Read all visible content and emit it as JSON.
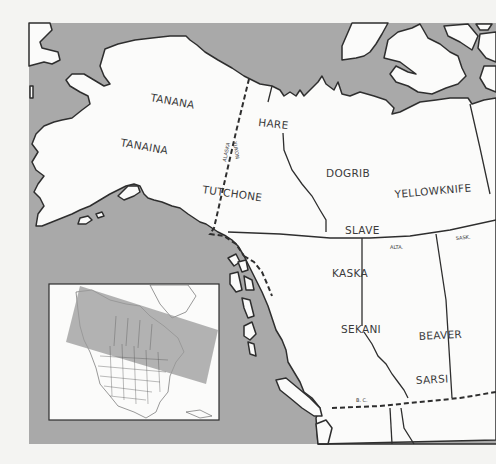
{
  "map": {
    "title": "Athapaskan peoples of northwestern North America",
    "colors": {
      "ocean": "#a9a9a9",
      "land": "#fbfbfa",
      "outline": "#2e2e2e",
      "paper": "#f4f4f2",
      "inset_highlight": "#9a9a9a"
    },
    "tribes": [
      {
        "name": "TANANA",
        "x": 168,
        "y": 101,
        "rotate": 10
      },
      {
        "name": "TANAINA",
        "x": 120,
        "y": 150,
        "rotate": 10
      },
      {
        "name": "TUTCHONE",
        "x": 200,
        "y": 196,
        "rotate": 8
      },
      {
        "name": "HARE",
        "x": 258,
        "y": 126,
        "rotate": 6
      },
      {
        "name": "DOGRIB",
        "x": 326,
        "y": 176,
        "rotate": 0
      },
      {
        "name": "YELLOWKNIFE",
        "x": 394,
        "y": 195,
        "rotate": -5
      },
      {
        "name": "SLAVE",
        "x": 345,
        "y": 232,
        "rotate": 0
      },
      {
        "name": "KASKA",
        "x": 332,
        "y": 276,
        "rotate": 0
      },
      {
        "name": "SEKANI",
        "x": 341,
        "y": 332,
        "rotate": 0
      },
      {
        "name": "BEAVER",
        "x": 419,
        "y": 339,
        "rotate": -3
      },
      {
        "name": "SARSI",
        "x": 416,
        "y": 383,
        "rotate": -3
      }
    ],
    "region_labels": [
      {
        "name": "ALASKA",
        "x": 224,
        "y": 148,
        "rotate": -80
      },
      {
        "name": "YUKON",
        "x": 237,
        "y": 152,
        "rotate": 80
      },
      {
        "name": "ALTA.",
        "x": 388,
        "y": 248,
        "rotate": 0
      },
      {
        "name": "SASK.",
        "x": 458,
        "y": 240,
        "rotate": -5
      },
      {
        "name": "B. C.",
        "x": 358,
        "y": 402,
        "rotate": 0
      }
    ],
    "inset": {
      "description": "Locator map of North America with shaded area of interest",
      "highlight": "Alaska, Canada"
    }
  }
}
